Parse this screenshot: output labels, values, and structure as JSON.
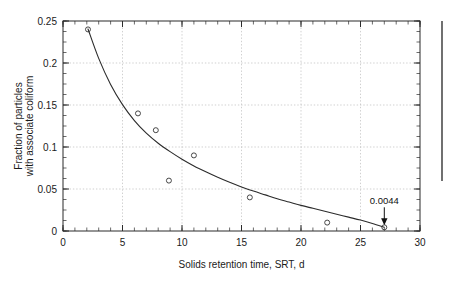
{
  "chart_data": {
    "type": "scatter",
    "title": "",
    "subtitle": "",
    "xlabel": "Solids retention time, SRT, d",
    "ylabel": "Fraction of particles with associate coliform",
    "ylabel_line1": "Fraction of particles",
    "ylabel_line2": "with associate coliform",
    "xlim": [
      0,
      30
    ],
    "ylim": [
      0,
      0.25
    ],
    "xticks": [
      0,
      5,
      10,
      15,
      20,
      25,
      30
    ],
    "xtick_labels": [
      "0",
      "5",
      "10",
      "15",
      "20",
      "25",
      "30"
    ],
    "yticks": [
      0,
      0.05,
      0.1,
      0.15,
      0.2,
      0.25
    ],
    "ytick_labels": [
      "0",
      "0.05",
      "0.1",
      "0.15",
      "0.2",
      "0.25"
    ],
    "x_minor_tick_step": 1,
    "y_minor_tick_step": 0.0125,
    "grid": true,
    "grid_style": "dotted",
    "legend": false,
    "legend_position": "none",
    "series": [
      {
        "name": "Measured data",
        "marker": "open-circle",
        "points": [
          {
            "x": 2.1,
            "y": 0.24
          },
          {
            "x": 6.3,
            "y": 0.14
          },
          {
            "x": 7.8,
            "y": 0.12
          },
          {
            "x": 8.9,
            "y": 0.06
          },
          {
            "x": 11.0,
            "y": 0.09
          },
          {
            "x": 15.7,
            "y": 0.04
          },
          {
            "x": 22.2,
            "y": 0.01
          },
          {
            "x": 27.0,
            "y": 0.0044
          }
        ]
      },
      {
        "name": "Fitted decay curve",
        "marker": "none",
        "style": "solid-line",
        "points": [
          {
            "x": 2.1,
            "y": 0.2405
          },
          {
            "x": 3.0,
            "y": 0.2055
          },
          {
            "x": 4.0,
            "y": 0.1745
          },
          {
            "x": 5.0,
            "y": 0.1505
          },
          {
            "x": 6.0,
            "y": 0.1315
          },
          {
            "x": 7.0,
            "y": 0.1165
          },
          {
            "x": 8.0,
            "y": 0.1045
          },
          {
            "x": 9.0,
            "y": 0.0945
          },
          {
            "x": 10.0,
            "y": 0.0855
          },
          {
            "x": 11.0,
            "y": 0.0775
          },
          {
            "x": 12.0,
            "y": 0.0705
          },
          {
            "x": 13.0,
            "y": 0.064
          },
          {
            "x": 14.0,
            "y": 0.058
          },
          {
            "x": 15.0,
            "y": 0.0525
          },
          {
            "x": 16.0,
            "y": 0.0475
          },
          {
            "x": 17.0,
            "y": 0.043
          },
          {
            "x": 18.0,
            "y": 0.0385
          },
          {
            "x": 19.0,
            "y": 0.0345
          },
          {
            "x": 20.0,
            "y": 0.0305
          },
          {
            "x": 21.0,
            "y": 0.027
          },
          {
            "x": 22.0,
            "y": 0.0235
          },
          {
            "x": 23.0,
            "y": 0.02
          },
          {
            "x": 24.0,
            "y": 0.0165
          },
          {
            "x": 25.0,
            "y": 0.013
          },
          {
            "x": 26.0,
            "y": 0.009
          },
          {
            "x": 27.0,
            "y": 0.0044
          }
        ]
      }
    ],
    "annotations": [
      {
        "text": "0.0044",
        "x": 27.0,
        "y": 0.0044,
        "arrow": true,
        "arrow_direction": "down"
      }
    ]
  },
  "sidebar_rule": {
    "present": true,
    "orientation": "vertical",
    "color": "#4d4d4d"
  }
}
